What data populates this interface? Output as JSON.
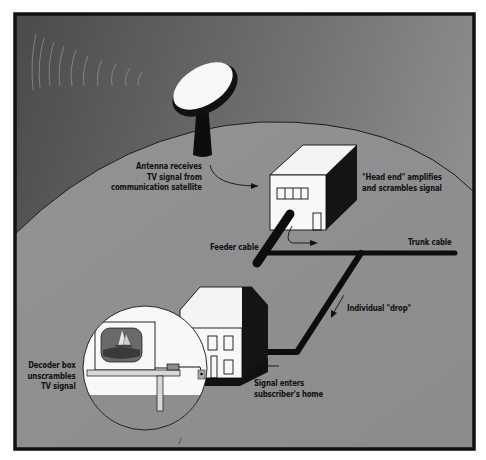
{
  "diagram": {
    "colors": {
      "sky_top_left": "#4d4d4d",
      "sky_top_right": "#8a8a8a",
      "ground": "#8e8e8e",
      "border": "#111111",
      "building_face": "#f7f7f7",
      "building_shadow": "#1a1a1a",
      "cable": "#0d0d0d"
    },
    "labels": {
      "antenna": {
        "line1": "Antenna receives",
        "line2": "TV signal from",
        "line3": "communication satellite"
      },
      "head_end": {
        "line1": "\"Head end\" amplifies",
        "line2": "and scrambles signal"
      },
      "feeder_cable": "Feeder cable",
      "trunk_cable": "Trunk cable",
      "individual_drop": "Individual \"drop\"",
      "signal_enters": {
        "line1": "Signal enters",
        "line2": "subscriber's home"
      },
      "decoder_box": {
        "line1": "Decoder box",
        "line2": "unscrambles",
        "line3": "TV signal"
      }
    },
    "components": [
      {
        "name": "satellite-dish-antenna"
      },
      {
        "name": "head-end-building"
      },
      {
        "name": "feeder-cable"
      },
      {
        "name": "trunk-cable"
      },
      {
        "name": "individual-drop-cable"
      },
      {
        "name": "subscriber-house"
      },
      {
        "name": "decoder-box-inset"
      }
    ]
  }
}
